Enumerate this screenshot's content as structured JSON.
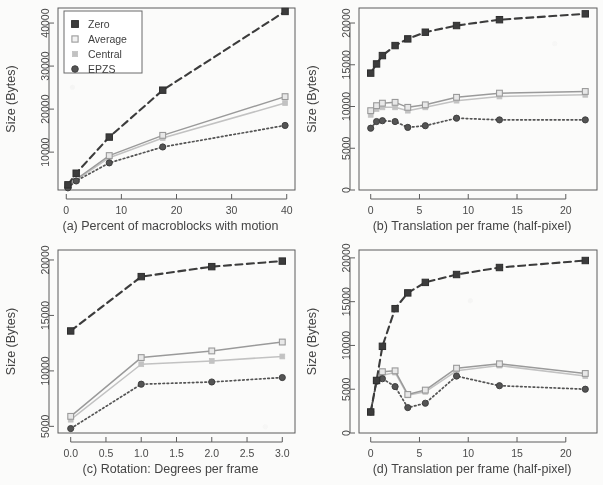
{
  "figure": {
    "shared_y_axis_label": "Size (Bytes)",
    "legend": {
      "location": "top-left of panel (a)",
      "entries": [
        {
          "label": "Zero",
          "marker": "filled-square-marker",
          "line": "dashed",
          "color": "#3c3c3c"
        },
        {
          "label": "Average",
          "marker": "open-square-marker",
          "line": "solid",
          "color": "#9a9a9a"
        },
        {
          "label": "Central",
          "marker": "small-light-square-marker",
          "line": "solid",
          "color": "#c2c2c2"
        },
        {
          "label": "EPZS",
          "marker": "filled-circle-marker",
          "line": "dotted",
          "color": "#545454"
        }
      ]
    }
  },
  "chart_data": [
    {
      "panel": "a",
      "type": "line",
      "title": "",
      "caption": "(a) Percent of macroblocks with motion",
      "xlabel": "(a) Percent of macroblocks with motion",
      "ylabel": "Size (Bytes)",
      "x": [
        0.3,
        1.8,
        7.8,
        17.5,
        39.7
      ],
      "xticks": [
        0,
        10,
        20,
        30,
        40
      ],
      "yticks": [
        10000,
        20000,
        30000,
        40000
      ],
      "xlim": [
        -1.5,
        41.5
      ],
      "ylim": [
        1200,
        43500
      ],
      "grid": false,
      "series": [
        {
          "name": "Zero",
          "values": [
            2400,
            5100,
            13500,
            24400,
            42700
          ]
        },
        {
          "name": "Average",
          "values": [
            2000,
            3700,
            9200,
            13900,
            22900
          ]
        },
        {
          "name": "Central",
          "values": [
            1900,
            3500,
            8700,
            13300,
            21400
          ]
        },
        {
          "name": "EPZS",
          "values": [
            1700,
            3300,
            7500,
            11200,
            16200
          ]
        }
      ]
    },
    {
      "panel": "b",
      "type": "line",
      "title": "",
      "caption": "(b) Translation per frame (half-pixel)",
      "xlabel": "(b) Translation per frame (half-pixel)",
      "ylabel": "Size (Bytes)",
      "x": [
        0,
        0.6,
        1.2,
        2.5,
        3.8,
        5.6,
        8.8,
        13.2,
        22.0
      ],
      "xticks": [
        0,
        5,
        10,
        15,
        20
      ],
      "yticks": [
        0,
        5000,
        10000,
        15000,
        20000
      ],
      "xlim": [
        -1.2,
        23.2
      ],
      "ylim": [
        0,
        21800
      ],
      "grid": false,
      "series": [
        {
          "name": "Zero",
          "values": [
            14000,
            15100,
            16100,
            17300,
            18100,
            18900,
            19700,
            20400,
            21100
          ]
        },
        {
          "name": "Average",
          "values": [
            9500,
            10100,
            10400,
            10500,
            9900,
            10200,
            11100,
            11600,
            11800
          ]
        },
        {
          "name": "Central",
          "values": [
            9000,
            9700,
            9900,
            9900,
            9500,
            9900,
            10700,
            11200,
            11400
          ]
        },
        {
          "name": "EPZS",
          "values": [
            7400,
            8200,
            8300,
            8200,
            7500,
            7700,
            8600,
            8400,
            8400
          ]
        }
      ]
    },
    {
      "panel": "c",
      "type": "line",
      "title": "",
      "caption": "(c) Rotation: Degrees per frame",
      "xlabel": "(c) Rotation: Degrees per frame",
      "ylabel": "Size (Bytes)",
      "x": [
        0.0,
        1.0,
        2.0,
        3.0
      ],
      "xticks": [
        0.0,
        0.5,
        1.0,
        1.5,
        2.0,
        2.5,
        3.0
      ],
      "xticklabels": [
        "0.0",
        "0.5",
        "1.0",
        "1.5",
        "2.0",
        "2.5",
        "3.0"
      ],
      "yticks": [
        5000,
        10000,
        15000,
        20000
      ],
      "xlim": [
        -0.18,
        3.18
      ],
      "ylim": [
        4400,
        20900
      ],
      "grid": false,
      "series": [
        {
          "name": "Zero",
          "values": [
            13600,
            18500,
            19400,
            19900
          ]
        },
        {
          "name": "Average",
          "values": [
            5900,
            11200,
            11800,
            12600
          ]
        },
        {
          "name": "Central",
          "values": [
            5600,
            10600,
            10900,
            11300
          ]
        },
        {
          "name": "EPZS",
          "values": [
            4800,
            8800,
            9000,
            9400
          ]
        }
      ]
    },
    {
      "panel": "d",
      "type": "line",
      "title": "",
      "caption": "(d) Translation per frame (half-pixel)",
      "xlabel": "(d) Translation per frame (half-pixel)",
      "ylabel": "Size (Bytes)",
      "x": [
        0,
        0.6,
        1.2,
        2.5,
        3.8,
        5.6,
        8.8,
        13.2,
        22.0
      ],
      "xticks": [
        0,
        5,
        10,
        15,
        20
      ],
      "yticks": [
        0,
        5000,
        10000,
        15000,
        20000
      ],
      "xlim": [
        -1.2,
        23.2
      ],
      "ylim": [
        0,
        20900
      ],
      "grid": false,
      "series": [
        {
          "name": "Zero",
          "values": [
            2400,
            6000,
            9900,
            14200,
            16000,
            17200,
            18100,
            18900,
            19700
          ]
        },
        {
          "name": "Average",
          "values": [
            2400,
            6000,
            7000,
            7100,
            4400,
            4900,
            7400,
            7900,
            6800
          ]
        },
        {
          "name": "Central",
          "values": [
            2400,
            6000,
            6600,
            6900,
            4300,
            4700,
            7100,
            7700,
            6500
          ]
        },
        {
          "name": "EPZS",
          "values": [
            2400,
            5900,
            6200,
            5300,
            2900,
            3400,
            6500,
            5400,
            5000
          ]
        }
      ]
    }
  ]
}
